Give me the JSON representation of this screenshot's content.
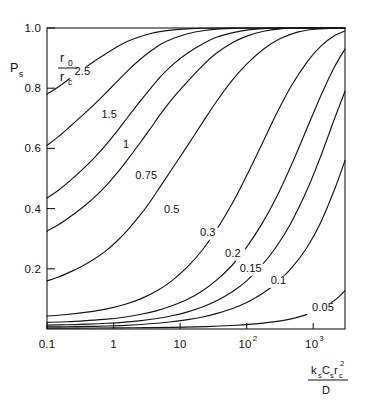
{
  "chart_data": {
    "type": "line",
    "title": "",
    "subtitle": "",
    "xlabel": "ksCsrc2/D",
    "xlabel_parts": {
      "numerator": [
        {
          "base": "k",
          "sub": "s"
        },
        {
          "base": "C",
          "sub": "s"
        },
        {
          "base": "r",
          "sub": "c",
          "sup": "2"
        }
      ],
      "denominator": "D"
    },
    "ylabel": "Ps",
    "ylabel_parts": {
      "base": "P",
      "sub": "s"
    },
    "xscale": "log",
    "yscale": "linear",
    "xlim": [
      0.1,
      3000
    ],
    "ylim": [
      0.0,
      1.0
    ],
    "grid": false,
    "legend_position": "inline-curve-labels",
    "legend_title_parts": {
      "numerator": {
        "base": "r",
        "sub": "0"
      },
      "denominator": {
        "base": "r",
        "sub": "c"
      }
    },
    "xticks": [
      {
        "value": 0.1,
        "label": "0.1",
        "exp": null
      },
      {
        "value": 1,
        "label": "1",
        "exp": null
      },
      {
        "value": 10,
        "label": "10",
        "exp": null
      },
      {
        "value": 100,
        "label": "10",
        "exp": "2"
      },
      {
        "value": 1000,
        "label": "10",
        "exp": "3"
      }
    ],
    "yticks": [
      {
        "value": 1.0,
        "label": "1.0"
      },
      {
        "value": 0.8,
        "label": "0.8"
      },
      {
        "value": 0.6,
        "label": "0.6"
      },
      {
        "value": 0.4,
        "label": "0.4"
      },
      {
        "value": 0.2,
        "label": "0.2"
      }
    ],
    "series": [
      {
        "name": "2.5",
        "label": "2.5",
        "label_pos": {
          "x": 0.34,
          "y": 0.845
        },
        "points": [
          [
            0.1,
            0.78
          ],
          [
            0.15,
            0.805
          ],
          [
            0.22,
            0.832
          ],
          [
            0.33,
            0.86
          ],
          [
            0.5,
            0.888
          ],
          [
            0.75,
            0.913
          ],
          [
            1.1,
            0.936
          ],
          [
            1.6,
            0.955
          ],
          [
            2.4,
            0.97
          ],
          [
            3.5,
            0.981
          ],
          [
            5.2,
            0.989
          ],
          [
            8.0,
            0.994
          ],
          [
            13,
            0.997
          ],
          [
            22,
            0.999
          ],
          [
            40,
            1.0
          ],
          [
            100,
            1.0
          ],
          [
            300,
            1.0
          ],
          [
            1000,
            1.0
          ],
          [
            3000,
            1.0
          ]
        ]
      },
      {
        "name": "1.5",
        "label": "1.5",
        "label_pos": {
          "x": 0.86,
          "y": 0.7
        },
        "points": [
          [
            0.1,
            0.61
          ],
          [
            0.15,
            0.64
          ],
          [
            0.22,
            0.672
          ],
          [
            0.33,
            0.707
          ],
          [
            0.5,
            0.744
          ],
          [
            0.75,
            0.782
          ],
          [
            1.1,
            0.82
          ],
          [
            1.6,
            0.856
          ],
          [
            2.4,
            0.892
          ],
          [
            3.5,
            0.921
          ],
          [
            5.2,
            0.947
          ],
          [
            8.0,
            0.966
          ],
          [
            13,
            0.981
          ],
          [
            22,
            0.991
          ],
          [
            40,
            0.997
          ],
          [
            70,
            0.999
          ],
          [
            130,
            1.0
          ],
          [
            400,
            1.0
          ],
          [
            1200,
            1.0
          ],
          [
            3000,
            1.0
          ]
        ]
      },
      {
        "name": "1",
        "label": "1",
        "label_pos": {
          "x": 1.55,
          "y": 0.6
        },
        "points": [
          [
            0.1,
            0.435
          ],
          [
            0.15,
            0.462
          ],
          [
            0.22,
            0.492
          ],
          [
            0.33,
            0.527
          ],
          [
            0.5,
            0.566
          ],
          [
            0.75,
            0.609
          ],
          [
            1.1,
            0.654
          ],
          [
            1.6,
            0.701
          ],
          [
            2.4,
            0.751
          ],
          [
            3.5,
            0.796
          ],
          [
            5.2,
            0.841
          ],
          [
            8.0,
            0.881
          ],
          [
            13,
            0.917
          ],
          [
            22,
            0.948
          ],
          [
            35,
            0.969
          ],
          [
            60,
            0.984
          ],
          [
            100,
            0.993
          ],
          [
            180,
            0.998
          ],
          [
            320,
            1.0
          ],
          [
            800,
            1.0
          ],
          [
            2000,
            1.0
          ],
          [
            3000,
            1.0
          ]
        ]
      },
      {
        "name": "0.75",
        "label": "0.75",
        "label_pos": {
          "x": 3.1,
          "y": 0.5
        },
        "points": [
          [
            0.1,
            0.325
          ],
          [
            0.15,
            0.347
          ],
          [
            0.22,
            0.372
          ],
          [
            0.33,
            0.401
          ],
          [
            0.5,
            0.435
          ],
          [
            0.75,
            0.473
          ],
          [
            1.1,
            0.515
          ],
          [
            1.6,
            0.561
          ],
          [
            2.4,
            0.613
          ],
          [
            3.5,
            0.663
          ],
          [
            5.2,
            0.717
          ],
          [
            8.0,
            0.77
          ],
          [
            13,
            0.823
          ],
          [
            22,
            0.876
          ],
          [
            35,
            0.916
          ],
          [
            60,
            0.95
          ],
          [
            100,
            0.973
          ],
          [
            180,
            0.989
          ],
          [
            320,
            0.997
          ],
          [
            600,
            1.0
          ],
          [
            1500,
            1.0
          ],
          [
            3000,
            1.0
          ]
        ]
      },
      {
        "name": "0.5",
        "label": "0.5",
        "label_pos": {
          "x": 7.5,
          "y": 0.385
        },
        "points": [
          [
            0.1,
            0.16
          ],
          [
            0.15,
            0.173
          ],
          [
            0.22,
            0.189
          ],
          [
            0.33,
            0.208
          ],
          [
            0.5,
            0.231
          ],
          [
            0.75,
            0.258
          ],
          [
            1.1,
            0.29
          ],
          [
            1.6,
            0.327
          ],
          [
            2.4,
            0.373
          ],
          [
            3.5,
            0.421
          ],
          [
            5.2,
            0.478
          ],
          [
            8.0,
            0.54
          ],
          [
            13,
            0.61
          ],
          [
            22,
            0.688
          ],
          [
            35,
            0.755
          ],
          [
            60,
            0.825
          ],
          [
            100,
            0.88
          ],
          [
            180,
            0.93
          ],
          [
            320,
            0.965
          ],
          [
            600,
            0.987
          ],
          [
            1100,
            0.996
          ],
          [
            2000,
            0.999
          ],
          [
            3000,
            1.0
          ]
        ]
      },
      {
        "name": "0.3",
        "label": "0.3",
        "label_pos": {
          "x": 26,
          "y": 0.31
        },
        "points": [
          [
            0.1,
            0.043
          ],
          [
            0.2,
            0.048
          ],
          [
            0.4,
            0.056
          ],
          [
            0.8,
            0.067
          ],
          [
            1.5,
            0.082
          ],
          [
            2.6,
            0.101
          ],
          [
            4.5,
            0.127
          ],
          [
            7.5,
            0.16
          ],
          [
            13,
            0.207
          ],
          [
            22,
            0.265
          ],
          [
            36,
            0.333
          ],
          [
            60,
            0.415
          ],
          [
            100,
            0.51
          ],
          [
            170,
            0.615
          ],
          [
            280,
            0.715
          ],
          [
            470,
            0.808
          ],
          [
            800,
            0.886
          ],
          [
            1300,
            0.94
          ],
          [
            2100,
            0.975
          ],
          [
            3000,
            0.99
          ]
        ]
      },
      {
        "name": "0.2",
        "label": "0.2",
        "label_pos": {
          "x": 62,
          "y": 0.24
        },
        "points": [
          [
            0.1,
            0.022
          ],
          [
            0.2,
            0.024
          ],
          [
            0.4,
            0.028
          ],
          [
            0.8,
            0.033
          ],
          [
            1.5,
            0.04
          ],
          [
            2.6,
            0.049
          ],
          [
            4.5,
            0.061
          ],
          [
            7.5,
            0.077
          ],
          [
            13,
            0.099
          ],
          [
            22,
            0.128
          ],
          [
            36,
            0.164
          ],
          [
            60,
            0.211
          ],
          [
            100,
            0.272
          ],
          [
            170,
            0.35
          ],
          [
            280,
            0.438
          ],
          [
            470,
            0.545
          ],
          [
            800,
            0.665
          ],
          [
            1300,
            0.775
          ],
          [
            2100,
            0.872
          ],
          [
            3000,
            0.93
          ]
        ]
      },
      {
        "name": "0.15",
        "label": "0.15",
        "label_pos": {
          "x": 115,
          "y": 0.19
        },
        "points": [
          [
            0.1,
            0.013
          ],
          [
            0.2,
            0.014
          ],
          [
            0.4,
            0.016
          ],
          [
            0.8,
            0.019
          ],
          [
            1.5,
            0.023
          ],
          [
            2.6,
            0.028
          ],
          [
            4.5,
            0.035
          ],
          [
            7.5,
            0.044
          ],
          [
            13,
            0.057
          ],
          [
            22,
            0.074
          ],
          [
            36,
            0.095
          ],
          [
            60,
            0.123
          ],
          [
            100,
            0.16
          ],
          [
            170,
            0.212
          ],
          [
            280,
            0.274
          ],
          [
            470,
            0.355
          ],
          [
            800,
            0.46
          ],
          [
            1300,
            0.575
          ],
          [
            2100,
            0.7
          ],
          [
            3000,
            0.79
          ]
        ]
      },
      {
        "name": "0.1",
        "label": "0.1",
        "label_pos": {
          "x": 300,
          "y": 0.15
        },
        "points": [
          [
            0.1,
            0.007
          ],
          [
            0.2,
            0.0075
          ],
          [
            0.4,
            0.0085
          ],
          [
            0.8,
            0.01
          ],
          [
            1.5,
            0.012
          ],
          [
            2.6,
            0.015
          ],
          [
            4.5,
            0.019
          ],
          [
            7.5,
            0.024
          ],
          [
            13,
            0.031
          ],
          [
            22,
            0.04
          ],
          [
            36,
            0.052
          ],
          [
            60,
            0.067
          ],
          [
            100,
            0.088
          ],
          [
            170,
            0.117
          ],
          [
            280,
            0.153
          ],
          [
            470,
            0.202
          ],
          [
            800,
            0.27
          ],
          [
            1300,
            0.355
          ],
          [
            2100,
            0.465
          ],
          [
            3000,
            0.56
          ]
        ]
      },
      {
        "name": "0.05",
        "label": "0.05",
        "label_pos": {
          "x": 1400,
          "y": 0.06
        },
        "points": [
          [
            0.1,
            0.003
          ],
          [
            0.5,
            0.0033
          ],
          [
            2,
            0.004
          ],
          [
            8,
            0.0055
          ],
          [
            25,
            0.008
          ],
          [
            60,
            0.0115
          ],
          [
            120,
            0.016
          ],
          [
            250,
            0.0235
          ],
          [
            450,
            0.033
          ],
          [
            750,
            0.046
          ],
          [
            1200,
            0.064
          ],
          [
            1800,
            0.085
          ],
          [
            2400,
            0.106
          ],
          [
            3000,
            0.127
          ]
        ]
      }
    ]
  },
  "geometry": {
    "plot_left": 47,
    "plot_right": 345,
    "plot_top": 28,
    "plot_bottom": 329
  }
}
